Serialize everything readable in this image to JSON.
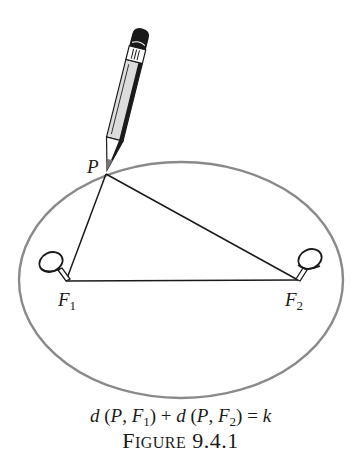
{
  "figure": {
    "caption_prefix_first": "F",
    "caption_prefix_rest": "IGURE",
    "caption_number": "9.4.1",
    "equation": {
      "d1": "d",
      "open1": " (",
      "p1": "P",
      "sep1": ", ",
      "f1": "F",
      "f1_sub": "1",
      "close1": ")",
      "plus": " + ",
      "d2": "d",
      "open2": " (",
      "p2": "P",
      "sep2": ", ",
      "f2": "F",
      "f2_sub": "2",
      "close2": ")",
      "eq": " = ",
      "k": "k"
    },
    "labels": {
      "point": "P",
      "focus1": "F",
      "focus1_sub": "1",
      "focus2": "F",
      "focus2_sub": "2"
    },
    "colors": {
      "ellipse": "#8a8a8a",
      "lines": "#1a1a1a",
      "pencil_body": "#dcdcdc",
      "pencil_dark": "#1a1a1a"
    },
    "geometry": {
      "ellipse": {
        "cx": 181,
        "cy": 280,
        "rx": 162,
        "ry": 118
      },
      "P": [
        106,
        174
      ],
      "F1": [
        66,
        281
      ],
      "F2": [
        298,
        280
      ]
    }
  }
}
